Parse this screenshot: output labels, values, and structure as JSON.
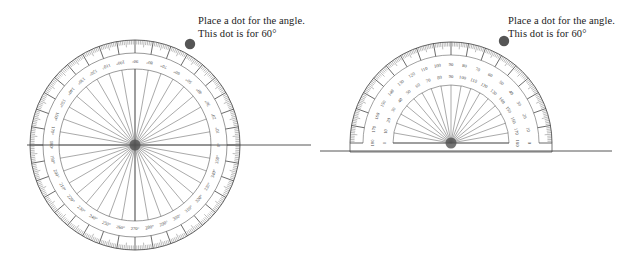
{
  "page": {
    "background_color": "#ffffff",
    "width": 623,
    "height": 271
  },
  "instruction": {
    "line1": "Place a dot for the angle.",
    "line2": "This dot is for 60°",
    "target_angle_deg": 60,
    "text_color": "#1a1a1a"
  },
  "colors": {
    "ink": "#555555",
    "ink_dark": "#3a3a3a",
    "tick": "#666666",
    "label": "#4a4a4a",
    "dot": "#555555",
    "ray": "#444444"
  },
  "panels": [
    {
      "id": "left",
      "name": "full-circle-protractor-panel",
      "protractor": {
        "type": "circular",
        "span_deg": 360,
        "center": {
          "x": 135,
          "y": 145
        },
        "radius_outer": 105,
        "radius_tick_inner": 92,
        "radius_label": 84,
        "radius_fan": 76,
        "major_step_deg": 10,
        "minor_step_deg": 1,
        "spoke_step_deg": 10,
        "has_horizontal_diameter": true,
        "labels": [
          "0°",
          "10°",
          "20°",
          "30°",
          "40°",
          "50°",
          "60°",
          "70°",
          "80°",
          "90°",
          "100°",
          "110°",
          "120°",
          "130°",
          "140°",
          "150°",
          "160°",
          "170°",
          "180°",
          "190°",
          "200°",
          "210°",
          "220°",
          "230°",
          "240°",
          "250°",
          "260°",
          "270°",
          "280°",
          "290°",
          "300°",
          "310°",
          "320°",
          "330°",
          "340°",
          "350°"
        ]
      },
      "ray": {
        "from_center": true,
        "angle_deg": 0,
        "end_x": 311,
        "label": "baseline-ray"
      },
      "dot": {
        "angle_deg": 60,
        "x": 190,
        "y": 44,
        "radius": 5.2
      }
    },
    {
      "id": "right",
      "name": "half-circle-protractor-panel",
      "protractor": {
        "type": "semicircular",
        "span_deg": 180,
        "center": {
          "x": 139,
          "y": 143
        },
        "radius_outer": 101,
        "radius_tick_inner": 88,
        "radius_label_outer": 78,
        "radius_label_inner": 66,
        "radius_fan": 58,
        "major_step_deg": 10,
        "minor_step_deg": 1,
        "spoke_step_deg": 10,
        "has_base_rule": true,
        "base_rule_offset": 9,
        "outer_scale_labels": [
          "180",
          "170",
          "160",
          "150",
          "140",
          "130",
          "120",
          "110",
          "100",
          "90",
          "80",
          "70",
          "60",
          "50",
          "40",
          "30",
          "20",
          "10",
          "0"
        ],
        "inner_scale_labels": [
          "0",
          "10",
          "20",
          "30",
          "40",
          "50",
          "60",
          "70",
          "80",
          "90",
          "100",
          "110",
          "120",
          "130",
          "140",
          "150",
          "160",
          "170",
          "180"
        ]
      },
      "ray": {
        "from_center": true,
        "angle_deg": 0,
        "end_x": 300,
        "label": "baseline-ray"
      },
      "dot": {
        "angle_deg": 60,
        "x": 192,
        "y": 41,
        "radius": 5.2
      }
    }
  ]
}
